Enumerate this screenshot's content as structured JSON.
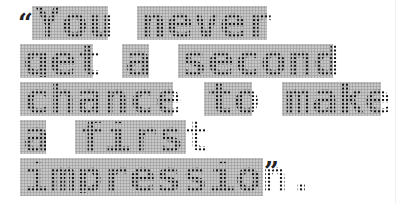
{
  "quote": {
    "open_mark": "“",
    "close_mark": "”",
    "full_text": "You never get a second chance to make a first impression.",
    "lines": [
      {
        "words": [
          "You",
          "never"
        ]
      },
      {
        "words": [
          "get",
          "a",
          "second"
        ]
      },
      {
        "words": [
          "chance",
          "to",
          "make"
        ]
      },
      {
        "words": [
          "a",
          "first"
        ]
      },
      {
        "words": [
          "impression."
        ]
      }
    ]
  },
  "style": {
    "block_color": "#c8c8c8",
    "dot_color": "#111111",
    "background": "#ffffff"
  }
}
